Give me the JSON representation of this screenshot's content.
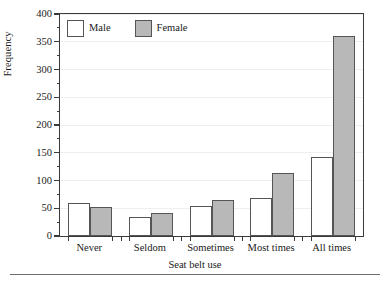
{
  "chart_data": {
    "type": "bar",
    "title": "",
    "subtitle": "",
    "xlabel": "Seat belt use",
    "ylabel": "Frequency",
    "categories": [
      "Never",
      "Seldom",
      "Sometimes",
      "Most times",
      "All times"
    ],
    "series": [
      {
        "name": "Male",
        "color": "#ffffff",
        "values": [
          60,
          34,
          54,
          68,
          143
        ]
      },
      {
        "name": "Female",
        "color": "#b8b8b8",
        "values": [
          53,
          41,
          65,
          113,
          360
        ]
      }
    ],
    "ylim": [
      0,
      400
    ],
    "ytick_step": 50,
    "yminor_step": 25,
    "ytick_labels": [
      "0",
      "50",
      "100",
      "150",
      "200",
      "250",
      "300",
      "350",
      "400"
    ],
    "grid": true,
    "grid_axis": "y",
    "legend_position": "top-left",
    "bar_edge_color": "#555555",
    "axis_color": "#3a3a3a",
    "grid_color": "#efefef"
  },
  "legend": {
    "entries": [
      {
        "label": "Male"
      },
      {
        "label": "Female"
      }
    ]
  }
}
